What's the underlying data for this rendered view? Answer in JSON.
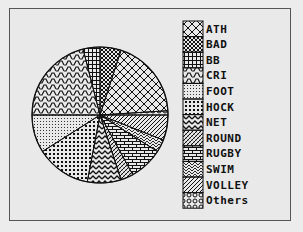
{
  "chart_data": {
    "type": "pie",
    "title": "",
    "legend_position": "right",
    "categories": [
      "ATH",
      "BAD",
      "BB",
      "CRI",
      "FOOT",
      "HOCK",
      "NET",
      "ROUND",
      "RUGBY",
      "SWIM",
      "VOLLEY",
      "Others"
    ],
    "values": [
      19,
      5,
      4,
      21,
      9,
      13,
      8,
      3,
      8,
      3,
      6,
      1
    ],
    "slice_order_clockwise_from_top": [
      "BAD",
      "ATH",
      "Others",
      "VOLLEY",
      "SWIM",
      "RUGBY",
      "ROUND",
      "NET",
      "HOCK",
      "FOOT",
      "CRI",
      "BB"
    ],
    "patterns": {
      "ATH": "crosshatch",
      "BAD": "dense-crosshatch",
      "BB": "grid",
      "CRI": "steps",
      "FOOT": "fine-dots",
      "HOCK": "dots",
      "NET": "zigzag",
      "ROUND": "diagonal-hatch",
      "RUGBY": "bricks",
      "SWIM": "herringbone",
      "VOLLEY": "diagonal-lines",
      "Others": "circles"
    }
  },
  "legend": {
    "items": [
      {
        "label": "ATH"
      },
      {
        "label": "BAD"
      },
      {
        "label": "BB"
      },
      {
        "label": "CRI"
      },
      {
        "label": "FOOT"
      },
      {
        "label": "HOCK"
      },
      {
        "label": "NET"
      },
      {
        "label": "ROUND"
      },
      {
        "label": "RUGBY"
      },
      {
        "label": "SWIM"
      },
      {
        "label": "VOLLEY"
      },
      {
        "label": "Others"
      }
    ]
  },
  "colors": {
    "ink": "#111111",
    "paper": "#e9e9e9"
  }
}
